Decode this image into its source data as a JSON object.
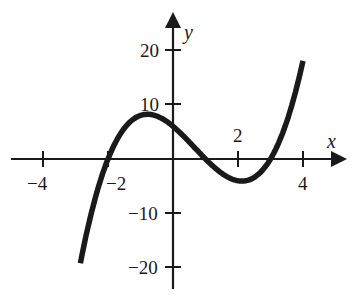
{
  "chart_data": {
    "type": "line",
    "title": "",
    "xlabel": "x",
    "ylabel": "y",
    "function": "y = (x+2)(x-1)(x-3) = x^3 - 2x^2 - 5x + 6",
    "xlim": [
      -4.9,
      5.3
    ],
    "ylim": [
      -24,
      25
    ],
    "grid": false,
    "legend": null,
    "x_ticks": [
      -4,
      -2,
      2,
      4
    ],
    "x_tick_labels": [
      "−4",
      "−2",
      "2",
      "4"
    ],
    "y_ticks": [
      20,
      10,
      -10,
      -20
    ],
    "y_tick_labels": [
      "20",
      "10",
      "−10",
      "−20"
    ],
    "series": [
      {
        "name": "cubic",
        "x": [
          -2.85,
          -2.5,
          -2,
          -1.5,
          -1,
          -0.5,
          0,
          0.5,
          1,
          1.5,
          2,
          2.5,
          3,
          3.5,
          4
        ],
        "y": [
          -19.1,
          -9.6,
          0,
          5.6,
          8,
          7.9,
          6,
          3.4,
          0,
          -2.6,
          -4,
          -3.4,
          0,
          4.1,
          18
        ]
      }
    ],
    "key_points": {
      "roots": [
        -2,
        1,
        3
      ],
      "y_intercept": 6,
      "local_max": [
        -0.79,
        8.2
      ],
      "local_min": [
        2.12,
        -4.1
      ]
    }
  },
  "labels": {
    "x_axis": "x",
    "y_axis": "y",
    "xt_m4": "−4",
    "xt_m2": "−2",
    "xt_2": "2",
    "xt_4": "4",
    "yt_20": "20",
    "yt_10": "10",
    "yt_m10": "−10",
    "yt_m20": "−20"
  },
  "colors": {
    "ink": "#1a1a1a",
    "background": "#ffffff"
  }
}
